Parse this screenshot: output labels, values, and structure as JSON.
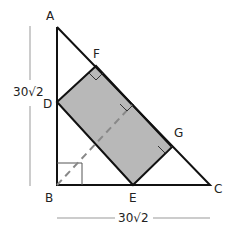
{
  "diagram": {
    "points": {
      "A": {
        "label": "A",
        "x": 57,
        "y": 27
      },
      "B": {
        "label": "B",
        "x": 57,
        "y": 185
      },
      "C": {
        "label": "C",
        "x": 210,
        "y": 185
      },
      "D": {
        "label": "D",
        "x": 57,
        "y": 102
      },
      "E": {
        "label": "E",
        "x": 133,
        "y": 185
      },
      "F": {
        "label": "F",
        "x": 96,
        "y": 66
      },
      "G": {
        "label": "G",
        "x": 172,
        "y": 147
      }
    },
    "dimensions": {
      "vertical": "30√2",
      "horizontal": "30√2"
    },
    "colors": {
      "stroke": "#111111",
      "fill": "#b8b8b8",
      "dashed": "#888888",
      "dimension_line": "#999999"
    }
  }
}
